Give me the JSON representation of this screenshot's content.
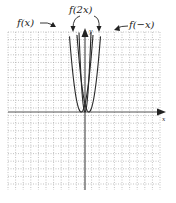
{
  "chart_data": {
    "type": "line",
    "title": "",
    "xlabel": "x",
    "ylabel": "y",
    "grid": true,
    "grid_style": "dotted",
    "xlim": [
      -10,
      10
    ],
    "ylim": [
      -10,
      10
    ],
    "series": [
      {
        "name": "f(x)",
        "label": "f(x)",
        "vertex": [
          -0.5,
          0
        ],
        "shape": "parabola",
        "width_factor": 1
      },
      {
        "name": "f(2x)",
        "label": "f(2x)",
        "vertex": [
          0,
          0
        ],
        "shape": "parabola",
        "width_factor": 0.5
      },
      {
        "name": "f(-x)",
        "label": "f(−x)",
        "vertex": [
          0.5,
          0
        ],
        "shape": "parabola",
        "width_factor": 1
      }
    ]
  },
  "labels": {
    "fx": "f(x)",
    "f2x": "f(2x)",
    "fnegx": "f(−x)",
    "x_axis": "x",
    "y_axis": "y"
  },
  "colors": {
    "curve": "#2a2a2a",
    "axis": "#444444",
    "grid": "#9a9a9a",
    "background": "#ffffff"
  }
}
